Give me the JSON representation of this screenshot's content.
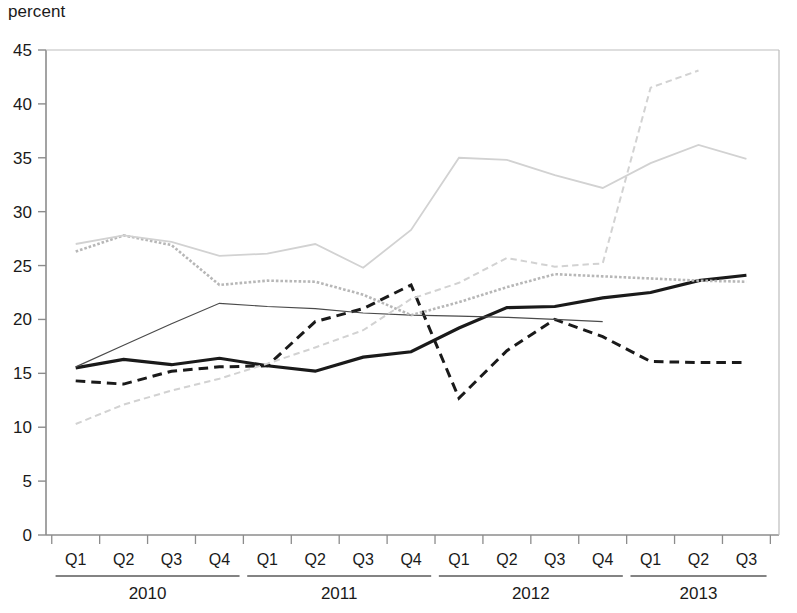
{
  "chart_data": {
    "type": "line",
    "title": "",
    "subtitle": "",
    "ylabel": "percent",
    "xlabel": "",
    "ylim": [
      0,
      45
    ],
    "yticks": [
      0,
      5,
      10,
      15,
      20,
      25,
      30,
      35,
      40,
      45
    ],
    "grid": false,
    "legend": "none",
    "x": [
      "2010 Q1",
      "2010 Q2",
      "2010 Q3",
      "2010 Q4",
      "2011 Q1",
      "2011 Q2",
      "2011 Q3",
      "2011 Q4",
      "2012 Q1",
      "2012 Q2",
      "2012 Q3",
      "2012 Q4",
      "2013 Q1",
      "2013 Q2",
      "2013 Q3"
    ],
    "quarter_labels": [
      "Q1",
      "Q2",
      "Q3",
      "Q4",
      "Q1",
      "Q2",
      "Q3",
      "Q4",
      "Q1",
      "Q2",
      "Q3",
      "Q4",
      "Q1",
      "Q2",
      "Q3"
    ],
    "year_groups": [
      {
        "label": "2010",
        "start": 0,
        "end": 3
      },
      {
        "label": "2011",
        "start": 4,
        "end": 7
      },
      {
        "label": "2012",
        "start": 8,
        "end": 11
      },
      {
        "label": "2013",
        "start": 12,
        "end": 14
      }
    ],
    "series": [
      {
        "name": "series-black-thick-solid",
        "style": "solid",
        "color": "#1a1a1a",
        "width": 3.2,
        "values": [
          15.5,
          16.3,
          15.8,
          16.4,
          15.7,
          15.2,
          16.5,
          17.0,
          19.2,
          21.1,
          21.2,
          22.0,
          22.5,
          23.6,
          24.1
        ]
      },
      {
        "name": "series-black-dashed",
        "style": "dashed",
        "color": "#1a1a1a",
        "width": 3.0,
        "values": [
          14.3,
          14.0,
          15.2,
          15.6,
          15.7,
          19.8,
          21.0,
          23.2,
          12.7,
          17.1,
          20.0,
          18.4,
          16.1,
          16.0,
          16.0
        ]
      },
      {
        "name": "series-black-thin-solid",
        "style": "solid",
        "color": "#4a4a4a",
        "width": 1.2,
        "values": [
          15.6,
          17.6,
          19.6,
          21.5,
          21.2,
          21.0,
          20.6,
          20.4,
          20.3,
          20.2,
          20.0,
          19.8,
          null,
          null,
          null
        ]
      },
      {
        "name": "series-gray-medium-dotted",
        "style": "dotted",
        "color": "#b7b7b7",
        "width": 2.6,
        "values": [
          26.3,
          27.8,
          26.9,
          23.2,
          23.6,
          23.5,
          22.3,
          20.4,
          21.6,
          23.0,
          24.2,
          24.0,
          23.8,
          23.6,
          23.5
        ]
      },
      {
        "name": "series-gray-light-solid",
        "style": "solid",
        "color": "#d2d2d2",
        "width": 1.8,
        "values": [
          27.0,
          27.8,
          27.2,
          25.9,
          26.1,
          27.0,
          24.8,
          28.3,
          35.0,
          34.8,
          33.4,
          32.2,
          34.5,
          36.2,
          34.9
        ]
      },
      {
        "name": "series-gray-light-dashed",
        "style": "dashed",
        "color": "#d2d2d2",
        "width": 2.0,
        "values": [
          10.3,
          12.1,
          13.4,
          14.5,
          15.9,
          17.4,
          19.0,
          21.9,
          23.4,
          25.7,
          24.9,
          25.2,
          41.5,
          43.1,
          null
        ]
      }
    ]
  }
}
